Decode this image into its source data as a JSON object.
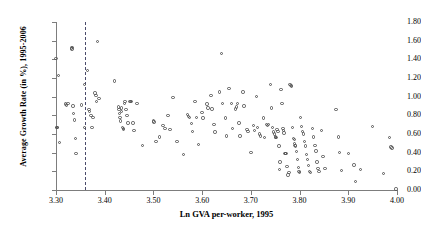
{
  "chart_data": {
    "type": "scatter",
    "title": "",
    "xlabel": "Ln GVA per-worker, 1995",
    "ylabel": "Average Growth Rate (in %), 1995-2006",
    "xlim": [
      3.3,
      4.0
    ],
    "ylim": [
      0.0,
      1.8
    ],
    "xticks": [
      "3.30",
      "3.40",
      "3.50",
      "3.60",
      "3.70",
      "3.80",
      "3.90",
      "4.00"
    ],
    "yticks": [
      "0.00",
      "0.20",
      "0.40",
      "0.60",
      "0.80",
      "1.00",
      "1.20",
      "1.40",
      "1.60",
      "1.80"
    ],
    "grid": false,
    "legend": null,
    "marker": "open-circle",
    "marker_color": "#555555",
    "annotations": [
      {
        "name": "vertical-reference-line",
        "type": "vline",
        "x": 3.36,
        "style": "dashed",
        "color": "#4a4a6a"
      }
    ],
    "points": [
      [
        3.3,
        1.41
      ],
      [
        3.301,
        0.67
      ],
      [
        3.302,
        0.67
      ],
      [
        3.303,
        0.67
      ],
      [
        3.305,
        1.23
      ],
      [
        3.307,
        0.51
      ],
      [
        3.32,
        0.92
      ],
      [
        3.322,
        0.91
      ],
      [
        3.325,
        0.93
      ],
      [
        3.332,
        1.52
      ],
      [
        3.333,
        1.51
      ],
      [
        3.334,
        1.53
      ],
      [
        3.335,
        0.9
      ],
      [
        3.336,
        0.82
      ],
      [
        3.338,
        0.75
      ],
      [
        3.34,
        0.55
      ],
      [
        3.341,
        0.39
      ],
      [
        3.352,
        0.91
      ],
      [
        3.358,
        1.13
      ],
      [
        3.359,
        0.67
      ],
      [
        3.365,
        1.28
      ],
      [
        3.368,
        0.86
      ],
      [
        3.369,
        0.84
      ],
      [
        3.372,
        0.8
      ],
      [
        3.374,
        0.67
      ],
      [
        3.376,
        0.78
      ],
      [
        3.38,
        1.04
      ],
      [
        3.382,
        1.01
      ],
      [
        3.383,
        0.95
      ],
      [
        3.385,
        1.59
      ],
      [
        3.388,
        0.98
      ],
      [
        3.42,
        1.17
      ],
      [
        3.428,
        0.89
      ],
      [
        3.429,
        0.86
      ],
      [
        3.43,
        0.82
      ],
      [
        3.431,
        0.78
      ],
      [
        3.432,
        0.74
      ],
      [
        3.434,
        0.88
      ],
      [
        3.435,
        0.84
      ],
      [
        3.437,
        0.67
      ],
      [
        3.438,
        0.66
      ],
      [
        3.439,
        0.65
      ],
      [
        3.441,
        0.93
      ],
      [
        3.442,
        0.95
      ],
      [
        3.444,
        0.86
      ],
      [
        3.446,
        0.8
      ],
      [
        3.448,
        0.72
      ],
      [
        3.452,
        0.95
      ],
      [
        3.453,
        0.95
      ],
      [
        3.455,
        0.95
      ],
      [
        3.458,
        0.72
      ],
      [
        3.46,
        0.64
      ],
      [
        3.466,
        0.93
      ],
      [
        3.478,
        0.48
      ],
      [
        3.5,
        0.74
      ],
      [
        3.501,
        0.73
      ],
      [
        3.505,
        0.52
      ],
      [
        3.512,
        0.57
      ],
      [
        3.52,
        0.69
      ],
      [
        3.524,
        0.66
      ],
      [
        3.53,
        0.8
      ],
      [
        3.534,
        0.65
      ],
      [
        3.54,
        0.99
      ],
      [
        3.548,
        0.52
      ],
      [
        3.562,
        0.38
      ],
      [
        3.57,
        0.81
      ],
      [
        3.572,
        0.79
      ],
      [
        3.574,
        0.78
      ],
      [
        3.578,
        0.71
      ],
      [
        3.58,
        0.63
      ],
      [
        3.585,
        0.95
      ],
      [
        3.588,
        0.78
      ],
      [
        3.592,
        0.49
      ],
      [
        3.6,
        0.83
      ],
      [
        3.602,
        0.77
      ],
      [
        3.61,
        0.92
      ],
      [
        3.612,
        0.88
      ],
      [
        3.618,
        1.01
      ],
      [
        3.62,
        0.87
      ],
      [
        3.624,
        0.7
      ],
      [
        3.626,
        0.62
      ],
      [
        3.635,
        1.05
      ],
      [
        3.64,
        1.46
      ],
      [
        3.642,
        0.93
      ],
      [
        3.648,
        0.77
      ],
      [
        3.65,
        0.58
      ],
      [
        3.655,
        1.09
      ],
      [
        3.66,
        0.93
      ],
      [
        3.662,
        0.66
      ],
      [
        3.668,
        0.87
      ],
      [
        3.67,
        0.89
      ],
      [
        3.672,
        0.93
      ],
      [
        3.676,
        0.72
      ],
      [
        3.678,
        0.58
      ],
      [
        3.684,
        1.05
      ],
      [
        3.686,
        0.9
      ],
      [
        3.692,
        0.65
      ],
      [
        3.694,
        0.63
      ],
      [
        3.7,
        0.4
      ],
      [
        3.705,
        0.69
      ],
      [
        3.708,
        0.64
      ],
      [
        3.712,
        1.0
      ],
      [
        3.714,
        0.67
      ],
      [
        3.718,
        0.6
      ],
      [
        3.72,
        0.58
      ],
      [
        3.726,
        0.77
      ],
      [
        3.728,
        0.56
      ],
      [
        3.732,
        0.7
      ],
      [
        3.734,
        0.69
      ],
      [
        3.736,
        0.7
      ],
      [
        3.74,
        1.13
      ],
      [
        3.742,
        0.88
      ],
      [
        3.745,
        0.67
      ],
      [
        3.746,
        0.62
      ],
      [
        3.748,
        0.6
      ],
      [
        3.75,
        0.57
      ],
      [
        3.751,
        0.56
      ],
      [
        3.752,
        0.56
      ],
      [
        3.754,
        0.65
      ],
      [
        3.756,
        0.63
      ],
      [
        3.758,
        0.47
      ],
      [
        3.759,
        0.22
      ],
      [
        3.76,
        0.3
      ],
      [
        3.762,
        1.08
      ],
      [
        3.764,
        0.93
      ],
      [
        3.766,
        0.66
      ],
      [
        3.767,
        0.64
      ],
      [
        3.768,
        0.61
      ],
      [
        3.77,
        0.39
      ],
      [
        3.771,
        0.39
      ],
      [
        3.772,
        0.39
      ],
      [
        3.774,
        0.25
      ],
      [
        3.776,
        0.16
      ],
      [
        3.778,
        0.19
      ],
      [
        3.78,
        1.13
      ],
      [
        3.782,
        1.12
      ],
      [
        3.784,
        1.11
      ],
      [
        3.786,
        0.67
      ],
      [
        3.788,
        0.55
      ],
      [
        3.789,
        0.54
      ],
      [
        3.79,
        0.5
      ],
      [
        3.791,
        0.48
      ],
      [
        3.792,
        0.47
      ],
      [
        3.794,
        0.41
      ],
      [
        3.796,
        0.33
      ],
      [
        3.798,
        0.24
      ],
      [
        3.799,
        0.2
      ],
      [
        3.8,
        0.19
      ],
      [
        3.802,
        0.78
      ],
      [
        3.804,
        0.68
      ],
      [
        3.806,
        0.63
      ],
      [
        3.808,
        0.6
      ],
      [
        3.81,
        0.52
      ],
      [
        3.812,
        0.47
      ],
      [
        3.814,
        0.38
      ],
      [
        3.816,
        0.33
      ],
      [
        3.818,
        0.26
      ],
      [
        3.82,
        0.2
      ],
      [
        3.822,
        0.19
      ],
      [
        3.826,
        0.66
      ],
      [
        3.828,
        0.57
      ],
      [
        3.832,
        0.48
      ],
      [
        3.834,
        0.42
      ],
      [
        3.836,
        0.3
      ],
      [
        3.838,
        0.23
      ],
      [
        3.84,
        0.2
      ],
      [
        3.845,
        0.64
      ],
      [
        3.848,
        0.36
      ],
      [
        3.852,
        0.23
      ],
      [
        3.875,
        0.86
      ],
      [
        3.88,
        0.57
      ],
      [
        3.882,
        0.4
      ],
      [
        3.886,
        0.21
      ],
      [
        3.9,
        0.39
      ],
      [
        3.912,
        0.27
      ],
      [
        3.915,
        0.09
      ],
      [
        3.925,
        0.22
      ],
      [
        3.95,
        0.68
      ],
      [
        3.972,
        0.18
      ],
      [
        3.985,
        0.56
      ],
      [
        3.988,
        0.46
      ],
      [
        3.99,
        0.45
      ],
      [
        3.998,
        0.01
      ]
    ]
  }
}
